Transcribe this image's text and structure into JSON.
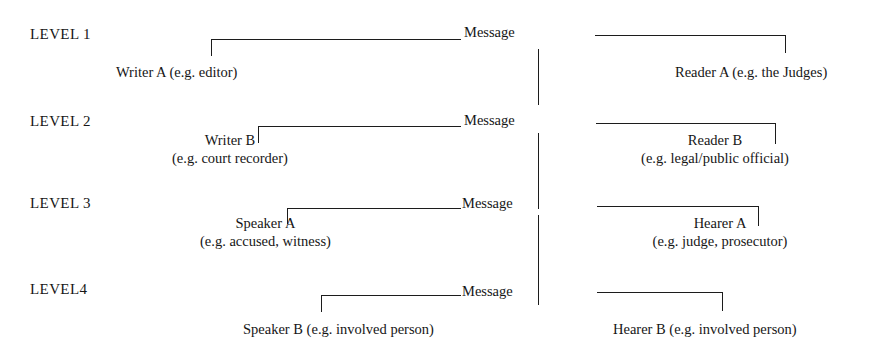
{
  "diagram": {
    "message_label": "Message",
    "line_color": "#1c1c1c",
    "text_color": "#161616",
    "background": "#ffffff",
    "levels": [
      {
        "label": "LEVEL 1",
        "sender": {
          "name": "Writer A (e.g. editor)",
          "detail": ""
        },
        "receiver": {
          "name": "Reader A (e.g. the Judges)",
          "detail": ""
        },
        "message": "Message"
      },
      {
        "label": "LEVEL 2",
        "sender": {
          "name": "Writer B",
          "detail": "(e.g. court recorder)"
        },
        "receiver": {
          "name": "Reader B",
          "detail": "(e.g. legal/public official)"
        },
        "message": "Message"
      },
      {
        "label": "LEVEL 3",
        "sender": {
          "name": "Speaker A",
          "detail": "(e.g. accused, witness)"
        },
        "receiver": {
          "name": "Hearer A",
          "detail": "(e.g. judge, prosecutor)"
        },
        "message": "Message"
      },
      {
        "label": "LEVEL4",
        "sender": {
          "name": "Speaker B (e.g. involved person)",
          "detail": ""
        },
        "receiver": {
          "name": "Hearer B (e.g. involved person)",
          "detail": ""
        },
        "message": "Message"
      }
    ]
  }
}
